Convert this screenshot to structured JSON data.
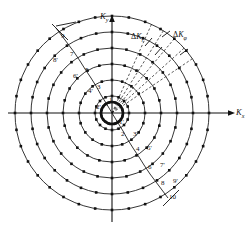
{
  "figure": {
    "type": "polar-spiral-sampling-grid",
    "background": "#ffffff",
    "ink_color": "#111111",
    "width": 247,
    "height": 228
  },
  "axes": {
    "x_label": "K",
    "x_sub": "x",
    "y_label": "K",
    "y_sub": "y",
    "origin": [
      112,
      113
    ],
    "x_axis_span": [
      8,
      232
    ],
    "y_axis_span": [
      16,
      222
    ]
  },
  "annotations": {
    "delta_kr": {
      "delta": "Δ",
      "k": "K",
      "sub": "r"
    },
    "delta_kphi": {
      "delta": "Δ",
      "k": "K",
      "sub": "φ"
    }
  },
  "spiral_labels_upper_left": [
    {
      "text": "9",
      "x": 61,
      "y": 33
    },
    {
      "text": "8'",
      "x": 53,
      "y": 57
    },
    {
      "text": "7",
      "x": 70,
      "y": 51
    },
    {
      "text": "6'",
      "x": 73,
      "y": 73
    },
    {
      "text": "5",
      "x": 85,
      "y": 67
    },
    {
      "text": "4'",
      "x": 88,
      "y": 88
    },
    {
      "text": "3",
      "x": 97,
      "y": 84
    },
    {
      "text": "1",
      "x": 109,
      "y": 97
    },
    {
      "text": "2'",
      "x": 96,
      "y": 104
    }
  ],
  "spiral_labels_lower_right": [
    {
      "text": "1'",
      "x": 119,
      "y": 119
    },
    {
      "text": "2",
      "x": 121,
      "y": 131
    },
    {
      "text": "3'",
      "x": 133,
      "y": 131
    },
    {
      "text": "4",
      "x": 136,
      "y": 146
    },
    {
      "text": "5'",
      "x": 147,
      "y": 145
    },
    {
      "text": "6",
      "x": 148,
      "y": 164
    },
    {
      "text": "7'",
      "x": 160,
      "y": 162
    },
    {
      "text": "8",
      "x": 161,
      "y": 180
    },
    {
      "text": "9'",
      "x": 173,
      "y": 178
    },
    {
      "text": "10",
      "x": 169,
      "y": 194
    }
  ],
  "rings": {
    "count": 6,
    "radii": [
      17,
      33,
      49,
      65,
      81,
      97
    ],
    "samples_per_ring": [
      16,
      20,
      24,
      28,
      32,
      36
    ]
  },
  "center_cluster": {
    "radius": 11,
    "dots": 20
  },
  "radial_spokes": {
    "count": 16
  },
  "dashed_spokes": {
    "count": 5,
    "angles_deg": [
      34,
      42,
      50,
      58,
      66
    ]
  }
}
